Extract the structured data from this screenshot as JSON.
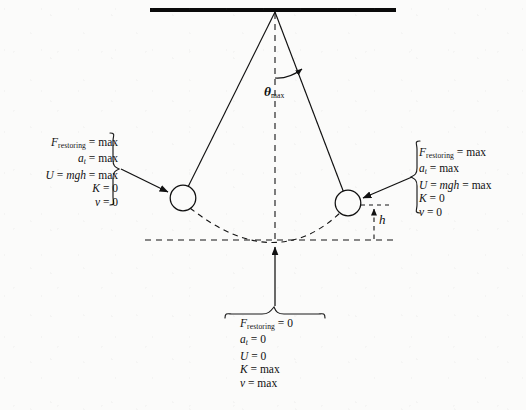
{
  "figure": {
    "type": "physics-diagram",
    "background_color": "#fbfbfa",
    "ink_color": "#111111"
  },
  "geometry": {
    "ceiling": {
      "x1": 150,
      "y1": 10,
      "x2": 396,
      "y2": 10,
      "thickness": 4
    },
    "pivot": {
      "x": 275,
      "y": 12
    },
    "string_left": {
      "x1": 275,
      "y1": 12,
      "x2": 183,
      "y2": 198
    },
    "string_right": {
      "x1": 275,
      "y1": 12,
      "x2": 348,
      "y2": 203
    },
    "vertical_dashed": {
      "x1": 275,
      "y1": 12,
      "x2": 275,
      "y2": 243
    },
    "bob_left": {
      "cx": 183,
      "cy": 198,
      "r": 13
    },
    "bob_right": {
      "cx": 348,
      "cy": 203,
      "r": 13
    },
    "baseline_dashed": {
      "x1": 145,
      "y1": 240,
      "x2": 396,
      "y2": 240
    },
    "swing_arc_dashed": "from left bob through lowest point at (275,240) to right bob",
    "height_marker": {
      "x": 374,
      "y_top": 205,
      "y_bottom": 240
    }
  },
  "theta": {
    "symbol": "θ",
    "subscript": "max",
    "arc_description": "angle between vertical dashed line and right string"
  },
  "height_label": {
    "symbol": "h"
  },
  "labels": {
    "left_extreme": {
      "position": "left",
      "brace": "right-facing",
      "align": "right",
      "arrow": {
        "from_x": 122,
        "from_y": 170,
        "to_x": 169,
        "to_y": 192
      },
      "lines": [
        {
          "symbol": "F",
          "subscript": "restoring",
          "relation": "=",
          "value": "max"
        },
        {
          "symbol": "a",
          "subscript": "t",
          "relation": "=",
          "value": "max"
        },
        {
          "symbol": "U",
          "relation": "=",
          "expression": "mgh",
          "relation2": "=",
          "value": "max"
        },
        {
          "symbol": "K",
          "relation": "=",
          "value": "0"
        },
        {
          "symbol": "v",
          "relation": "=",
          "value": "0"
        }
      ]
    },
    "right_extreme": {
      "position": "right",
      "brace": "left-facing",
      "align": "left",
      "arrow": {
        "from_x": 411,
        "from_y": 177,
        "to_x": 362,
        "to_y": 198
      },
      "lines": [
        {
          "symbol": "F",
          "subscript": "restoring",
          "relation": "=",
          "value": "max"
        },
        {
          "symbol": "a",
          "subscript": "t",
          "relation": "=",
          "value": "max"
        },
        {
          "symbol": "U",
          "relation": "=",
          "expression": "mgh",
          "relation2": "=",
          "value": "max"
        },
        {
          "symbol": "K",
          "relation": "=",
          "value": "0"
        },
        {
          "symbol": "v",
          "relation": "=",
          "value": "0"
        }
      ]
    },
    "lowest_point": {
      "position": "bottom",
      "brace": "top-facing",
      "align": "left",
      "arrow": {
        "from_x": 275,
        "from_y": 306,
        "to_x": 275,
        "to_y": 246
      },
      "lines": [
        {
          "symbol": "F",
          "subscript": "restoring",
          "relation": "=",
          "value": "0"
        },
        {
          "symbol": "a",
          "subscript": "t",
          "relation": "=",
          "value": "0"
        },
        {
          "symbol": "U",
          "relation": "=",
          "value": "0"
        },
        {
          "symbol": "K",
          "relation": "=",
          "value": "max"
        },
        {
          "symbol": "v",
          "relation": "=",
          "value": "max"
        }
      ]
    }
  },
  "text": {
    "F": "F",
    "a": "a",
    "U": "U",
    "K": "K",
    "v": "v",
    "mgh": "mgh",
    "eq": "=",
    "max": "max",
    "zero": "0",
    "sub_restoring": "restoring",
    "sub_t": "t",
    "theta_symbol": "θ",
    "theta_sub": "max",
    "h": "h"
  }
}
